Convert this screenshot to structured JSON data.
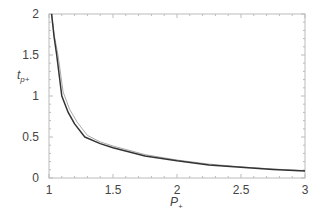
{
  "chart_data": {
    "type": "line",
    "title": "",
    "xlabel": "P+",
    "ylabel": "tp+",
    "xlim": [
      1,
      3
    ],
    "ylim": [
      0,
      2
    ],
    "xticks": [
      "1",
      "1.5",
      "2",
      "2.5",
      "3"
    ],
    "yticks": [
      "0",
      "0.5",
      "1",
      "1.5",
      "2"
    ],
    "grid": false,
    "legend": null,
    "series": [
      {
        "name": "curve-dark",
        "color": "#333333",
        "x": [
          1.02,
          1.04,
          1.06,
          1.1,
          1.15,
          1.2,
          1.28,
          1.4,
          1.5,
          1.75,
          2.0,
          2.25,
          2.5,
          2.75,
          3.0
        ],
        "y": [
          2.0,
          1.72,
          1.5,
          1.0,
          0.8,
          0.66,
          0.5,
          0.42,
          0.37,
          0.27,
          0.21,
          0.16,
          0.13,
          0.105,
          0.085
        ]
      },
      {
        "name": "curve-light",
        "color": "#aaaaaa",
        "x": [
          1.02,
          1.04,
          1.07,
          1.11,
          1.16,
          1.22,
          1.3,
          1.4,
          1.5,
          1.75,
          2.0,
          2.25,
          2.5,
          2.75,
          3.0
        ],
        "y": [
          2.0,
          1.75,
          1.5,
          1.05,
          0.84,
          0.68,
          0.52,
          0.44,
          0.39,
          0.285,
          0.22,
          0.17,
          0.135,
          0.11,
          0.09
        ]
      }
    ]
  },
  "labels": {
    "xlabel_main": "P",
    "xlabel_sub": "+",
    "ylabel_main": "t",
    "ylabel_sub": "p+"
  }
}
